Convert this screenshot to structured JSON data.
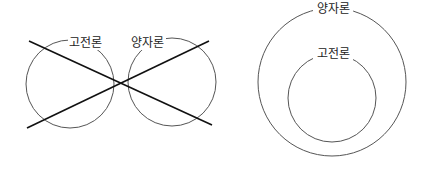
{
  "diagrams": [
    {
      "name": "separate-theories",
      "circles": [
        {
          "label": "고전론",
          "cx": 70,
          "cy": 84,
          "r": 44
        },
        {
          "label": "양자론",
          "cx": 172,
          "cy": 82,
          "r": 44
        }
      ],
      "crossed_out": true
    },
    {
      "name": "nested-theories",
      "circles": [
        {
          "label": "양자론",
          "cx": 332,
          "cy": 82,
          "r": 74
        },
        {
          "label": "고전론",
          "cx": 332,
          "cy": 98,
          "r": 44
        }
      ],
      "crossed_out": false
    }
  ],
  "colors": {
    "stroke": "#444444",
    "cross": "#111111",
    "text": "#222222"
  }
}
